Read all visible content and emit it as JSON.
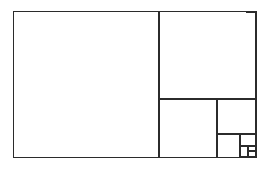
{
  "figure": {
    "name": "squared-rectangle",
    "background_color": "#ffffff",
    "stroke_color": "#2b2b2b",
    "stroke_width": 1.6,
    "canvas": {
      "width": 267,
      "height": 172
    }
  },
  "chart_data": {
    "type": "diagram",
    "title": "",
    "xlabel": "",
    "ylabel": "",
    "outer_rectangle": {
      "x": 14,
      "y": 12,
      "width": 242,
      "height": 145
    },
    "squares": [
      {
        "label": "square-1",
        "x": 14,
        "y": 12,
        "size": 145
      },
      {
        "label": "square-2",
        "x": 159,
        "y": 12,
        "size": 87
      },
      {
        "label": "square-3",
        "x": 159,
        "y": 99,
        "size": 58
      },
      {
        "label": "square-4",
        "x": 217,
        "y": 99,
        "size": 35
      },
      {
        "label": "square-5",
        "x": 217,
        "y": 134,
        "size": 23
      },
      {
        "label": "square-6",
        "x": 240,
        "y": 134,
        "size": 12
      },
      {
        "label": "square-7",
        "x": 240,
        "y": 146,
        "size": 8
      },
      {
        "label": "square-8",
        "x": 248,
        "y": 146,
        "size": 5
      }
    ],
    "divider_lines": [
      {
        "label": "divider-vertical-main",
        "x1": 159,
        "y1": 12,
        "x2": 159,
        "y2": 157
      },
      {
        "label": "divider-horizontal-2",
        "x1": 159,
        "y1": 99,
        "x2": 256,
        "y2": 99
      },
      {
        "label": "divider-vertical-3",
        "x1": 217,
        "y1": 99,
        "x2": 217,
        "y2": 157
      },
      {
        "label": "divider-horizontal-4",
        "x1": 217,
        "y1": 134,
        "x2": 256,
        "y2": 134
      },
      {
        "label": "divider-vertical-5",
        "x1": 240,
        "y1": 134,
        "x2": 240,
        "y2": 157
      },
      {
        "label": "divider-horizontal-6",
        "x1": 240,
        "y1": 146,
        "x2": 256,
        "y2": 146
      },
      {
        "label": "divider-vertical-7",
        "x1": 248,
        "y1": 146,
        "x2": 248,
        "y2": 157
      },
      {
        "label": "divider-horizontal-8",
        "x1": 248,
        "y1": 151,
        "x2": 256,
        "y2": 151
      }
    ]
  }
}
